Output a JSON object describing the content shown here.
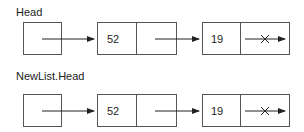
{
  "lists": [
    {
      "head_label": "Head",
      "nodes": [
        {
          "value": "52"
        },
        {
          "value": "19",
          "next": "null"
        }
      ]
    },
    {
      "head_label": "NewList.Head",
      "nodes": [
        {
          "value": "52"
        },
        {
          "value": "19",
          "next": "null"
        }
      ]
    }
  ],
  "colors": {
    "stroke": "#444444",
    "text": "#222222"
  }
}
